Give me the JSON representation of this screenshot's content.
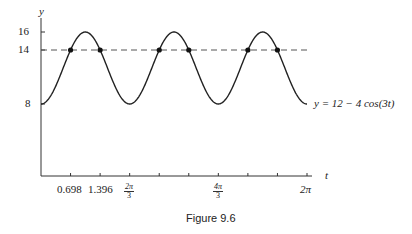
{
  "chart_data": {
    "type": "line",
    "title": "",
    "caption": "Figure 9.6",
    "xlabel": "t",
    "ylabel": "y",
    "function_label": "y = 12 − 4 cos(3t)",
    "series": [
      {
        "name": "y = 12 - 4cos(3t)",
        "style": "solid"
      },
      {
        "name": "y = 14",
        "style": "dashed",
        "value": 14
      }
    ],
    "xlim": [
      0,
      6.283
    ],
    "ylim": [
      0,
      16
    ],
    "x_tick_labels": [
      "0.698",
      "1.396",
      "2π/3",
      "4π/3",
      "2π"
    ],
    "y_tick_labels": [
      "8",
      "14",
      "16"
    ],
    "intersection_points_t": [
      0.698,
      1.396,
      2.793,
      3.491,
      4.887,
      5.585
    ],
    "intersection_y": 14,
    "grid": false,
    "legend": "none"
  },
  "labels": {
    "y_axis": "y",
    "t_axis": "t",
    "y16": "16",
    "y14": "14",
    "y8": "8",
    "x1": "0.698",
    "x2": "1.396",
    "x3_num": "2π",
    "x3_den": "3",
    "x4_num": "4π",
    "x4_den": "3",
    "x5": "2π",
    "func": "y = 12 − 4 cos(3t)",
    "caption": "Figure 9.6"
  }
}
